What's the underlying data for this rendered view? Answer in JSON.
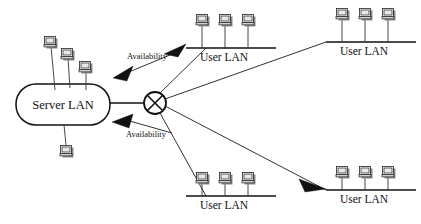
{
  "diagram": {
    "background_color": "#ffffff",
    "line_color": "#111111",
    "server_lan": {
      "label": "Server LAN",
      "shape": "rounded-rectangle",
      "x": 16,
      "y": 84,
      "width": 94,
      "height": 41,
      "computers_above": 3,
      "computers_below": 1
    },
    "hub": {
      "name": "crossed-circle-hub",
      "cx": 155,
      "cy": 103,
      "r": 11,
      "glyph": "circle-with-x"
    },
    "user_lans": [
      {
        "label": "User LAN",
        "x1": 186,
        "x2": 276,
        "y": 48,
        "computers": 3,
        "label_x": 224,
        "label_y": 61
      },
      {
        "label": "User LAN",
        "x1": 326,
        "x2": 416,
        "y": 42,
        "computers": 3,
        "label_x": 364,
        "label_y": 55
      },
      {
        "label": "User LAN",
        "x1": 186,
        "x2": 276,
        "y": 196,
        "computers": 3,
        "label_x": 224,
        "label_y": 209
      },
      {
        "label": "User LAN",
        "x1": 326,
        "x2": 416,
        "y": 190,
        "computers": 3,
        "label_x": 364,
        "label_y": 203
      }
    ],
    "annotations": [
      {
        "label": "Availability",
        "x": 147,
        "y": 59,
        "direction": "to-server-lan-upper"
      },
      {
        "label": "Availability",
        "x": 147,
        "y": 136,
        "direction": "to-server-lan-lower"
      }
    ],
    "arrowheads": [
      {
        "name": "arrow-to-server-upper",
        "points": "113,78 131,67 126,80"
      },
      {
        "name": "arrow-to-server-lower",
        "points": "113,122 132,115 128,127"
      },
      {
        "name": "arrow-to-user-lan-top-left",
        "points": "185,45 166,53 179,56"
      },
      {
        "name": "arrow-to-user-lan-bottom-right",
        "points": "325,188 301,180 307,192"
      }
    ]
  }
}
